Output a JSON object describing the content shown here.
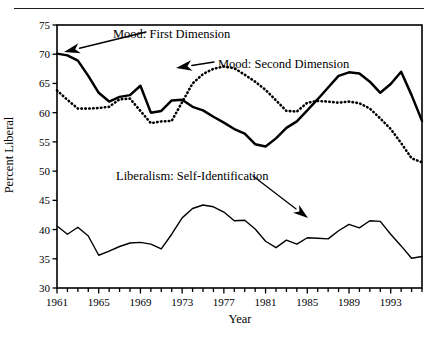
{
  "figure": {
    "top_rule": "horizontal-rule"
  },
  "chart_data": {
    "type": "line",
    "title": "",
    "xlabel": "Year",
    "ylabel": "Percent Liberal",
    "xlim": [
      1961,
      1996
    ],
    "ylim": [
      30,
      75
    ],
    "yticks": [
      30,
      35,
      40,
      45,
      50,
      55,
      60,
      65,
      70,
      75
    ],
    "xticks": [
      1961,
      1965,
      1969,
      1973,
      1977,
      1981,
      1985,
      1989,
      1993
    ],
    "xtick_minor_step": 1,
    "grid": false,
    "legend_position": "inline-annotations",
    "annotations": [
      {
        "name": "mood-first-dimension",
        "text": "Mood: First Dimension",
        "arrow_to": [
          1963.5,
          69.3
        ]
      },
      {
        "name": "mood-second-dimension",
        "text": "Mood: Second Dimension",
        "arrow_to": [
          1978.5,
          67.2
        ]
      },
      {
        "name": "liberalism-self-identification",
        "text": "Liberalism: Self-Identification",
        "arrow_to": [
          1988.5,
          41.5
        ]
      }
    ],
    "x": [
      1961,
      1962,
      1963,
      1964,
      1965,
      1966,
      1967,
      1968,
      1969,
      1970,
      1971,
      1972,
      1973,
      1974,
      1975,
      1976,
      1977,
      1978,
      1979,
      1980,
      1981,
      1982,
      1983,
      1984,
      1985,
      1986,
      1987,
      1988,
      1989,
      1990,
      1991,
      1992,
      1993,
      1994,
      1995,
      1996
    ],
    "series": [
      {
        "name": "Mood: First Dimension",
        "style": "solid",
        "color": "#000000",
        "values": [
          70.1,
          69.8,
          68.9,
          66.3,
          63.4,
          61.9,
          62.7,
          63.0,
          64.6,
          60.0,
          60.3,
          62.1,
          62.2,
          61.0,
          60.4,
          59.3,
          58.3,
          57.2,
          56.4,
          54.6,
          54.2,
          55.6,
          57.4,
          58.5,
          60.4,
          62.3,
          64.3,
          66.3,
          66.9,
          66.7,
          65.3,
          63.4,
          64.9,
          67.0,
          63.0,
          58.6
        ]
      },
      {
        "name": "Mood: Second Dimension",
        "style": "dotted",
        "color": "#000000",
        "values": [
          63.8,
          62.2,
          60.7,
          60.7,
          60.8,
          61.0,
          62.3,
          62.4,
          60.3,
          58.2,
          58.5,
          58.6,
          61.8,
          65.0,
          66.6,
          67.5,
          67.9,
          67.6,
          66.5,
          65.3,
          63.9,
          62.1,
          60.3,
          60.2,
          61.7,
          62.0,
          61.9,
          61.7,
          61.9,
          61.6,
          60.7,
          59.0,
          57.2,
          54.8,
          52.2,
          51.5
        ]
      },
      {
        "name": "Liberalism: Self-Identification",
        "style": "solid-thin",
        "color": "#000000",
        "values": [
          40.6,
          39.2,
          40.4,
          38.9,
          35.6,
          36.3,
          37.1,
          37.7,
          37.8,
          37.5,
          36.7,
          39.2,
          42.0,
          43.6,
          44.2,
          43.9,
          43.0,
          41.5,
          41.6,
          40.1,
          38.0,
          36.9,
          38.2,
          37.5,
          38.6,
          38.5,
          38.4,
          39.8,
          40.9,
          40.3,
          41.5,
          41.4,
          39.2,
          37.2,
          35.1,
          35.4
        ]
      }
    ]
  },
  "axis_ticks": {
    "y": [
      "30",
      "35",
      "40",
      "45",
      "50",
      "55",
      "60",
      "65",
      "70",
      "75"
    ],
    "x": [
      "1961",
      "1965",
      "1969",
      "1973",
      "1977",
      "1981",
      "1985",
      "1989",
      "1993"
    ]
  }
}
